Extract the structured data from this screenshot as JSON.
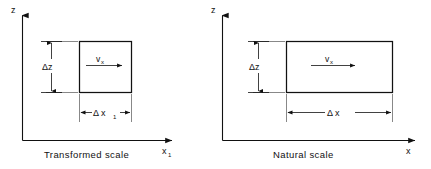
{
  "figure": {
    "background_color": "#ffffff",
    "line_color": "#111111",
    "panels": [
      {
        "id": "transformed",
        "caption": "Transformed scale",
        "y_axis_label": "z",
        "x_axis_label": "x",
        "x_axis_label_sub": "1",
        "height_label": "Δz",
        "width_label": "Δ x",
        "width_label_sub": "1",
        "velocity_label": "v",
        "velocity_label_sub": "x",
        "cell_shape": "square"
      },
      {
        "id": "natural",
        "caption": "Natural scale",
        "y_axis_label": "z",
        "x_axis_label": "x",
        "x_axis_label_sub": "",
        "height_label": "Δz",
        "width_label": "Δ x",
        "width_label_sub": "",
        "velocity_label": "v",
        "velocity_label_sub": "x",
        "cell_shape": "rectangle"
      }
    ]
  }
}
